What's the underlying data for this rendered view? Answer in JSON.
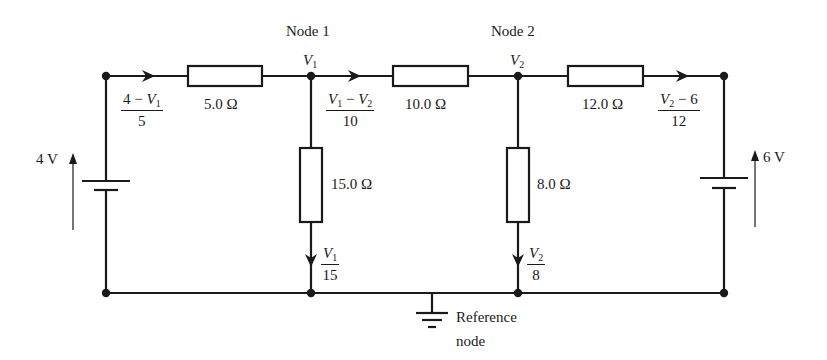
{
  "diagram": {
    "type": "circuit-nodal-analysis",
    "nodes": {
      "node1": {
        "title": "Node 1",
        "voltage_label": "V",
        "voltage_sub": "1"
      },
      "node2": {
        "title": "Node 2",
        "voltage_label": "V",
        "voltage_sub": "2"
      },
      "reference": {
        "line1": "Reference",
        "line2": "node"
      }
    },
    "sources": {
      "left": {
        "label": "4 V"
      },
      "right": {
        "label": "6 V"
      }
    },
    "resistors": {
      "r1": {
        "label": "5.0 Ω"
      },
      "r2": {
        "label": "10.0 Ω"
      },
      "r3": {
        "label": "12.0 Ω"
      },
      "r4": {
        "label": "15.0 Ω"
      },
      "r5": {
        "label": "8.0 Ω"
      }
    },
    "currents": {
      "i1": {
        "num_a": "4 − ",
        "num_var": "V",
        "num_sub": "1",
        "den": "5"
      },
      "i2": {
        "num_var1": "V",
        "num_sub1": "1",
        "num_mid": " − ",
        "num_var2": "V",
        "num_sub2": "2",
        "den": "10"
      },
      "i3": {
        "num_var": "V",
        "num_sub": "2",
        "num_b": " − 6",
        "den": "12"
      },
      "i4": {
        "num_var": "V",
        "num_sub": "1",
        "den": "15"
      },
      "i5": {
        "num_var": "V",
        "num_sub": "2",
        "den": "8"
      }
    }
  }
}
